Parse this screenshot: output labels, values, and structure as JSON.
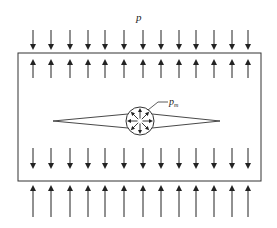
{
  "diagram": {
    "type": "physics-schematic",
    "labels": {
      "external_pressure": "p",
      "internal_pressure_main": "p",
      "internal_pressure_sub": "m"
    },
    "colors": {
      "stroke": "#222222",
      "background": "#ffffff"
    },
    "arrow_columns_x": [
      33,
      51,
      70,
      88,
      105,
      124,
      143,
      161,
      179,
      196,
      214,
      232,
      248
    ],
    "rows": [
      {
        "name": "top-outer",
        "direction": "down",
        "y1": 30,
        "y2": 47
      },
      {
        "name": "top-inner",
        "direction": "up",
        "y1": 78,
        "y2": 62
      },
      {
        "name": "bottom-inner",
        "direction": "down",
        "y1": 148,
        "y2": 166
      },
      {
        "name": "bottom-outer",
        "direction": "up",
        "y1": 217,
        "y2": 188
      }
    ],
    "rectangle": {
      "x": 18,
      "y": 53,
      "w": 243,
      "h": 128
    },
    "crack": {
      "left_tip_x": 53,
      "right_tip_x": 220,
      "center_y": 121,
      "half_width_at_hole": 7
    },
    "hole": {
      "cx": 140,
      "cy": 121,
      "r": 14
    }
  }
}
